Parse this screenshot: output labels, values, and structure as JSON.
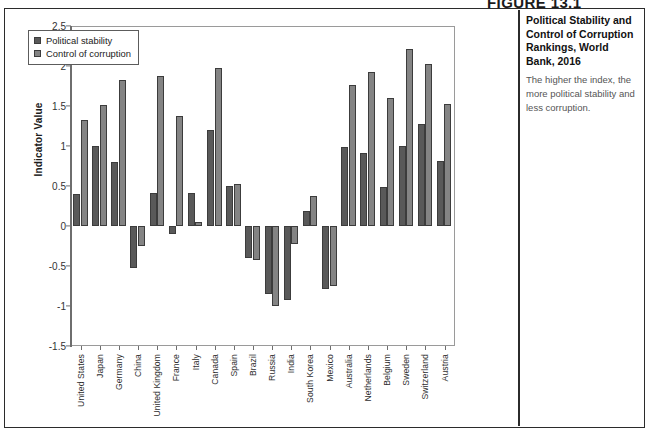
{
  "figure": {
    "header_label": "FIGURE 13.1",
    "caption_title": "Political Stability and Control of Corruption Rankings, World Bank, 2016",
    "caption_body": "The higher the index, the more political stability and less corruption."
  },
  "chart_data": {
    "type": "bar",
    "title": "Political Stability and Control of Corruption Rankings, World Bank, 2016",
    "xlabel": "",
    "ylabel": "Indicator Value",
    "ylim": [
      -1.5,
      2.5
    ],
    "ytick_step": 0.5,
    "yticks": [
      "2.5",
      "2",
      "1.5",
      "1",
      "0.5",
      "0",
      "-0.5",
      "-1",
      "-1.5"
    ],
    "ytick_values": [
      2.5,
      2,
      1.5,
      1,
      0.5,
      0,
      -0.5,
      -1,
      -1.5
    ],
    "grid": "horizontal-dashed",
    "legend_position": "top-left-inside",
    "categories": [
      "United States",
      "Japan",
      "Germany",
      "China",
      "United Kingdom",
      "France",
      "Italy",
      "Canada",
      "Spain",
      "Brazil",
      "Russia",
      "India",
      "South Korea",
      "Mexico",
      "Australia",
      "Netherlands",
      "Belgium",
      "Sweden",
      "Switzerland",
      "Austria"
    ],
    "series": [
      {
        "name": "Political stability",
        "color": "#595959",
        "values": [
          0.4,
          1.0,
          0.8,
          -0.52,
          0.41,
          -0.1,
          0.41,
          1.2,
          0.5,
          -0.4,
          -0.85,
          -0.93,
          0.19,
          -0.79,
          0.99,
          0.91,
          0.49,
          1.0,
          1.28,
          0.81
        ]
      },
      {
        "name": "Control of corruption",
        "color": "#848484",
        "values": [
          1.32,
          1.51,
          1.83,
          -0.25,
          1.88,
          1.37,
          0.05,
          1.98,
          0.52,
          -0.43,
          -1.0,
          -0.23,
          0.37,
          -0.75,
          1.76,
          1.93,
          1.6,
          2.21,
          2.03,
          1.53
        ]
      }
    ]
  },
  "legend": {
    "items": [
      {
        "label": "Political stability",
        "swatch": "ps"
      },
      {
        "label": "Control of corruption",
        "swatch": "cc"
      }
    ]
  }
}
